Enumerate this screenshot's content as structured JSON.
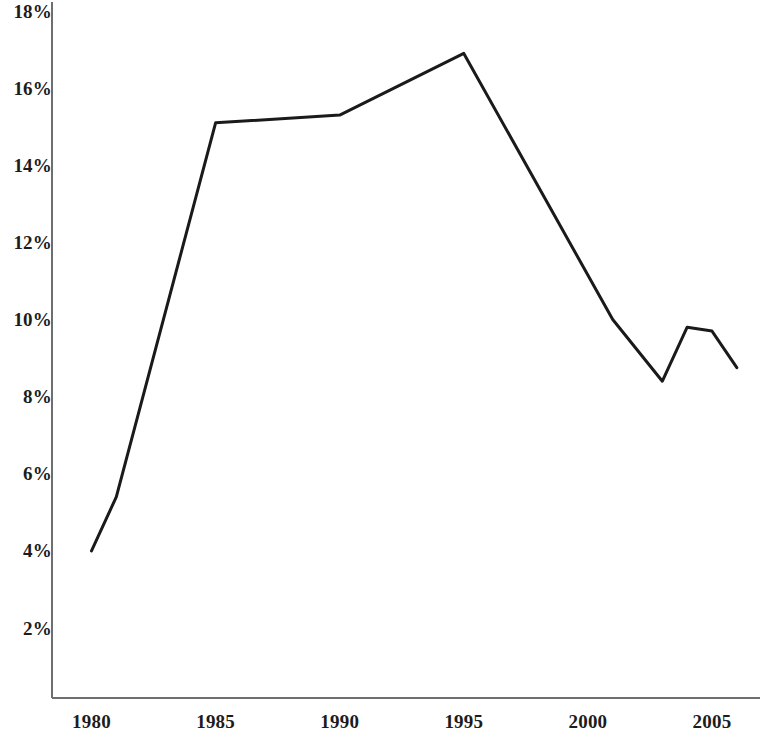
{
  "chart_data": {
    "type": "line",
    "title": "",
    "subtitle": "",
    "xlabel": "",
    "ylabel": "",
    "grid": false,
    "legend": "none",
    "xlim": [
      1979.2,
      2006.5
    ],
    "ylim": [
      0.6,
      18.0
    ],
    "x_ticks": [
      1980,
      1985,
      1990,
      1995,
      2000,
      2005
    ],
    "x_tick_labels": [
      "1980",
      "1985",
      "1990",
      "1995",
      "2000",
      "2005"
    ],
    "y_ticks": [
      2,
      4,
      6,
      8,
      10,
      12,
      14,
      16,
      18
    ],
    "y_tick_labels": [
      "2%",
      "4%",
      "6%",
      "8%",
      "10%",
      "12%",
      "14%",
      "16%",
      "18%"
    ],
    "series": [
      {
        "name": "",
        "color": "#1a1a1a",
        "line_width": 3,
        "x": [
          1980,
          1981,
          1985,
          1990,
          1995,
          2001,
          2003,
          2004,
          2005,
          2006
        ],
        "values": [
          4.0,
          5.4,
          15.1,
          15.3,
          16.9,
          10.0,
          8.4,
          9.8,
          9.7,
          8.75
        ]
      }
    ]
  },
  "axes": {
    "axis_color": "#6e6e6e",
    "axis_line_width": 2
  }
}
